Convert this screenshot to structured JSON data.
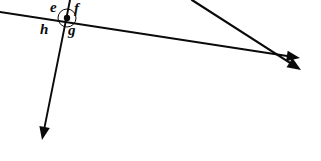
{
  "figure": {
    "kind": "geometry-line-diagram",
    "width": 321,
    "height": 161,
    "background_color": "#ffffff",
    "stroke_color": "#0a0a0a",
    "label_color": "#0a0a0a"
  },
  "labels": [
    {
      "id": "e",
      "text": "e",
      "x": 50,
      "y": 0,
      "position": "upper-left-of-vertex"
    },
    {
      "id": "f",
      "text": "f",
      "x": 74,
      "y": 1,
      "position": "upper-right-of-vertex"
    },
    {
      "id": "h",
      "text": "h",
      "x": 40,
      "y": 22,
      "position": "lower-left-of-vertex"
    },
    {
      "id": "g",
      "text": "g",
      "x": 68,
      "y": 23,
      "position": "lower-right-of-vertex"
    }
  ],
  "vertex": {
    "name": "intersection-point",
    "x": 67,
    "y": 18,
    "dot_radius": 3.2,
    "marker_circle_radius": 9,
    "marker_circle_stroke": 1
  },
  "lines": [
    {
      "id": "transversal",
      "name": "near-horizontal-ray",
      "x1": 0,
      "y1": 12,
      "x2": 300,
      "y2": 58,
      "stroke_width": 1.9,
      "arrow_at_end": true,
      "arrow_at_start": false
    },
    {
      "id": "steep",
      "name": "steep-descending-ray",
      "x1": 70,
      "y1": 0,
      "x2": 42,
      "y2": 140,
      "stroke_width": 1.9,
      "arrow_at_end": true,
      "arrow_at_start": false
    },
    {
      "id": "diagonal",
      "name": "right-diagonal-ray",
      "x1": 192,
      "y1": 0,
      "x2": 301,
      "y2": 70,
      "stroke_width": 2.2,
      "arrow_at_end": true,
      "arrow_at_start": false
    }
  ],
  "secondary_crossing": {
    "name": "right-crossing-point",
    "x": 272,
    "y": 56
  }
}
